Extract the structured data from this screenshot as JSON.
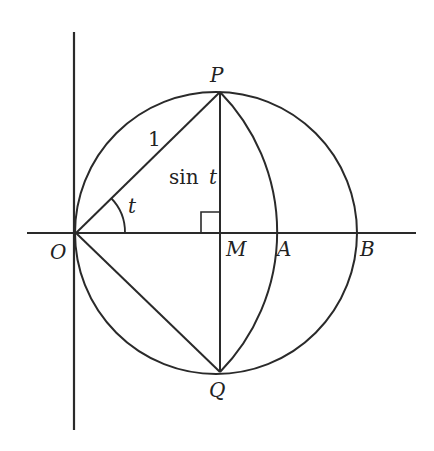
{
  "diagram": {
    "stroke_color": "#2a2a2a",
    "background": "#ffffff",
    "points": {
      "O": {
        "label": "O",
        "x": 76,
        "y": 233
      },
      "P": {
        "label": "P",
        "x": 220,
        "y": 92
      },
      "Q": {
        "label": "Q",
        "x": 220,
        "y": 372
      },
      "M": {
        "label": "M",
        "x": 220,
        "y": 233
      },
      "A": {
        "label": "A",
        "x": 275,
        "y": 233
      },
      "B": {
        "label": "B",
        "x": 357,
        "y": 233
      }
    },
    "labels": {
      "O": "O",
      "P": "P",
      "Q": "Q",
      "M": "M",
      "A": "A",
      "B": "B",
      "radius": "1",
      "angle": "t",
      "sin_prefix": "sin",
      "sin_var": "t"
    },
    "circle": {
      "cx": 216,
      "cy": 233,
      "r": 141
    },
    "axes": {
      "x_axis": {
        "x1": 27,
        "x2": 416,
        "y": 233
      },
      "y_axis": {
        "x": 74,
        "y1": 32,
        "y2": 430
      }
    }
  }
}
